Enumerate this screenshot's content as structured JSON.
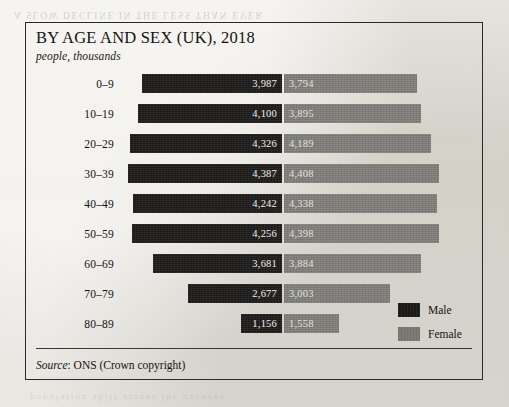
{
  "figure": {
    "title": "BY AGE AND SEX (UK), 2018",
    "subtitle": "people, thousands",
    "source_label": "Source",
    "source_text": ": ONS (Crown copyright)"
  },
  "legend": {
    "male_label": "Male",
    "female_label": "Female"
  },
  "colors": {
    "male": "#1c1a18",
    "female": "#7d7b76",
    "paper": "#e8e6e0",
    "frame": "#2c2a28",
    "value_text": "#f2f0ec"
  },
  "bleed": {
    "top": "A SLOW  DECLINE  IN  THE  LESS  THAN  EVER",
    "bottom": "population  shift  across  the  decades"
  },
  "chart_data": {
    "type": "bar",
    "title": "BY AGE AND SEX (UK), 2018",
    "subtitle": "people, thousands",
    "xlabel": "",
    "ylabel": "",
    "orientation": "horizontal",
    "style": "population-pyramid",
    "units": "thousands",
    "grid": false,
    "legend_position": "right-bottom",
    "categories": [
      "0–9",
      "10–19",
      "20–29",
      "30–39",
      "40–49",
      "50–59",
      "60–69",
      "70–79",
      "80–89"
    ],
    "series": [
      {
        "name": "Male",
        "color": "#1c1a18",
        "side": "left",
        "values": [
          3987,
          4100,
          4326,
          4387,
          4242,
          4256,
          3681,
          2677,
          1156
        ],
        "labels": [
          "3,987",
          "4,100",
          "4,326",
          "4,387",
          "4,242",
          "4,256",
          "3,681",
          "2,677",
          "1,156"
        ]
      },
      {
        "name": "Female",
        "color": "#7d7b76",
        "side": "right",
        "values": [
          3794,
          3895,
          4189,
          4408,
          4338,
          4398,
          3884,
          3003,
          1558
        ],
        "labels": [
          "3,794",
          "3,895",
          "4,189",
          "4,408",
          "4,338",
          "4,398",
          "3,884",
          "3,003",
          "1,558"
        ]
      }
    ],
    "max_value": 4408,
    "source": "Source: ONS (Crown copyright)"
  }
}
